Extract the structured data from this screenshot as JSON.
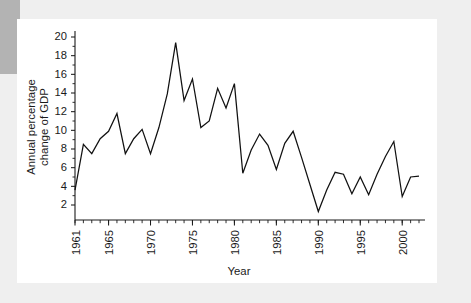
{
  "chart_data": {
    "type": "line",
    "title": "",
    "subtitle": "",
    "xlabel": "Year",
    "ylabel": "Annual percentage change of GDP",
    "ylabel_line1": "Annual percentage",
    "ylabel_line2": "change of GDP",
    "xlim": [
      1961,
      2002
    ],
    "ylim": [
      0,
      20.8
    ],
    "yticks": [
      2,
      4,
      6,
      8,
      10,
      12,
      14,
      16,
      18,
      20
    ],
    "ytick_labels": [
      "2",
      "4",
      "6",
      "8",
      "10",
      "12",
      "14",
      "16",
      "18",
      "20"
    ],
    "xticks": [
      1961,
      1965,
      1970,
      1975,
      1980,
      1985,
      1990,
      1995,
      2000
    ],
    "xtick_labels": [
      "1961",
      "1965",
      "1970",
      "1975",
      "1980",
      "1985",
      "1990",
      "1995",
      "2000"
    ],
    "xtick_minor_step": 1,
    "grid": false,
    "legend": false,
    "legend_position": "none",
    "line_color": "#111111",
    "background_color": "#ffffff",
    "x": [
      1961,
      1962,
      1963,
      1964,
      1965,
      1966,
      1967,
      1968,
      1969,
      1970,
      1971,
      1972,
      1973,
      1974,
      1975,
      1976,
      1977,
      1978,
      1979,
      1980,
      1981,
      1982,
      1983,
      1984,
      1985,
      1986,
      1987,
      1988,
      1989,
      1990,
      1991,
      1992,
      1993,
      1994,
      1995,
      1996,
      1997,
      1998,
      1999,
      2000,
      2001,
      2002
    ],
    "values": [
      3.6,
      8.5,
      7.5,
      9.1,
      9.9,
      11.8,
      7.5,
      9.1,
      10.1,
      7.5,
      10.3,
      13.9,
      19.4,
      13.2,
      15.5,
      10.3,
      11.0,
      14.5,
      12.4,
      15.0,
      5.4,
      7.9,
      9.6,
      8.4,
      5.8,
      8.6,
      9.9,
      7.1,
      4.2,
      1.3,
      3.6,
      5.5,
      5.3,
      3.2,
      5.0,
      3.1,
      5.3,
      7.2,
      8.8,
      2.9,
      5.0,
      5.1
    ],
    "series": [
      {
        "name": "Annual percentage change of GDP",
        "values": [
          3.6,
          8.5,
          7.5,
          9.1,
          9.9,
          11.8,
          7.5,
          9.1,
          10.1,
          7.5,
          10.3,
          13.9,
          19.4,
          13.2,
          15.5,
          10.3,
          11.0,
          14.5,
          12.4,
          15.0,
          5.4,
          7.9,
          9.6,
          8.4,
          5.8,
          8.6,
          9.9,
          7.1,
          4.2,
          1.3,
          3.6,
          5.5,
          5.3,
          3.2,
          5.0,
          3.1,
          5.3,
          7.2,
          8.8,
          2.9,
          5.0,
          5.1
        ]
      }
    ],
    "peak": {
      "year": 1973,
      "value": 19.4
    },
    "trough": {
      "year": 1990,
      "value": 1.3
    }
  }
}
